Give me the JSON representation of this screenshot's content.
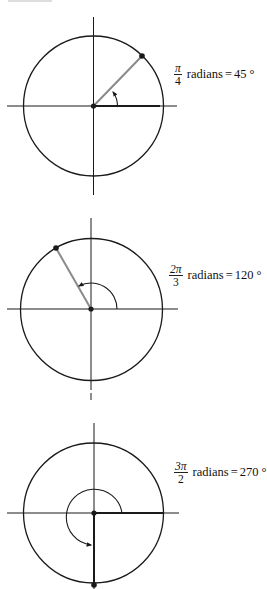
{
  "figures": [
    {
      "id": "fig-45",
      "numerator": "π",
      "denominator": "4",
      "unit_text": "radians",
      "equals": "=",
      "degrees": "45 °",
      "angle_deg": 45,
      "center": [
        93.5,
        106
      ],
      "radius": 70,
      "label_pos": [
        178,
        60
      ]
    },
    {
      "id": "fig-120",
      "numerator": "2π",
      "denominator": "3",
      "unit_text": "radians",
      "equals": "=",
      "degrees": "120 °",
      "angle_deg": 120,
      "center": [
        91,
        309
      ],
      "radius": 71,
      "label_pos": [
        170,
        262
      ]
    },
    {
      "id": "fig-270",
      "numerator": "3π",
      "denominator": "2",
      "unit_text": "radians",
      "equals": "=",
      "degrees": "270 °",
      "angle_deg": 270,
      "center": [
        94,
        513
      ],
      "radius": 70,
      "label_pos": [
        172,
        462
      ]
    }
  ],
  "colors": {
    "stroke": "#1a1a1a",
    "radius_line": "#8a8a8a"
  }
}
